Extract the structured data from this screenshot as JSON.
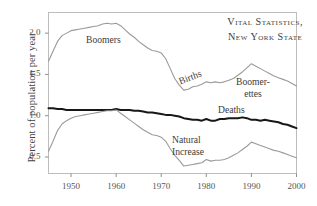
{
  "chart_data": {
    "type": "line",
    "title": "Vital Statistics, New York State",
    "title_line1": "Vital Statistics,",
    "title_line2": "New York State",
    "xlabel": "",
    "ylabel": "Percent of population per year",
    "xlim": [
      1945,
      2000
    ],
    "ylim": [
      0.3,
      2.25
    ],
    "grid": false,
    "legend": "inline-annotations",
    "xticks": [
      "1950",
      "1960",
      "1970",
      "1980",
      "1990",
      "2000"
    ],
    "xtick_values": [
      1950,
      1960,
      1970,
      1980,
      1990,
      2000
    ],
    "yticks": [
      "0.5",
      "1.0",
      "1.5",
      "2.0"
    ],
    "ytick_values": [
      0.5,
      1.0,
      1.5,
      2.0
    ],
    "annotations": [
      {
        "text": "Boomers",
        "series": "Births",
        "x": 1955,
        "y": 1.93
      },
      {
        "text": "Births",
        "series": "Births",
        "x": 1976,
        "y": 1.42
      },
      {
        "text": "Boomer-ettes",
        "line1": "Boomer-",
        "line2": "ettes",
        "series": "Births",
        "x": 1988,
        "y": 1.42
      },
      {
        "text": "Deaths",
        "series": "Deaths",
        "x": 1986,
        "y": 1.06
      },
      {
        "text": "Natural Increase",
        "line1": "Natural",
        "line2": "Increase",
        "series": "Natural Increase",
        "x": 1979,
        "y": 0.73
      }
    ],
    "x": [
      1945,
      1946,
      1947,
      1948,
      1949,
      1950,
      1951,
      1952,
      1953,
      1954,
      1955,
      1956,
      1957,
      1958,
      1959,
      1960,
      1961,
      1962,
      1963,
      1964,
      1965,
      1966,
      1967,
      1968,
      1969,
      1970,
      1971,
      1972,
      1973,
      1974,
      1975,
      1976,
      1977,
      1978,
      1979,
      1980,
      1981,
      1982,
      1983,
      1984,
      1985,
      1986,
      1987,
      1988,
      1989,
      1990,
      1991,
      1992,
      1993,
      1994,
      1995,
      1996,
      1997,
      1998,
      1999,
      2000
    ],
    "series": [
      {
        "name": "Births",
        "color": "#9a9a9a",
        "width": 1.1,
        "values": [
          1.66,
          1.78,
          1.9,
          1.97,
          2.0,
          2.03,
          2.04,
          2.05,
          2.06,
          2.07,
          2.08,
          2.09,
          2.11,
          2.12,
          2.11,
          2.12,
          2.09,
          2.04,
          1.99,
          1.95,
          1.9,
          1.86,
          1.82,
          1.79,
          1.78,
          1.76,
          1.69,
          1.57,
          1.45,
          1.37,
          1.31,
          1.32,
          1.35,
          1.36,
          1.38,
          1.41,
          1.4,
          1.41,
          1.4,
          1.41,
          1.43,
          1.45,
          1.49,
          1.53,
          1.58,
          1.63,
          1.6,
          1.57,
          1.54,
          1.51,
          1.48,
          1.46,
          1.44,
          1.42,
          1.39,
          1.36
        ]
      },
      {
        "name": "Deaths",
        "color": "#171717",
        "width": 2.0,
        "values": [
          1.09,
          1.09,
          1.08,
          1.08,
          1.07,
          1.07,
          1.07,
          1.07,
          1.07,
          1.07,
          1.07,
          1.07,
          1.07,
          1.07,
          1.07,
          1.08,
          1.07,
          1.07,
          1.07,
          1.06,
          1.06,
          1.05,
          1.04,
          1.04,
          1.03,
          1.02,
          1.01,
          1.01,
          1.0,
          0.99,
          0.97,
          0.96,
          0.95,
          0.95,
          0.94,
          0.96,
          0.94,
          0.94,
          0.96,
          0.96,
          0.97,
          0.97,
          0.97,
          0.98,
          0.97,
          0.95,
          0.95,
          0.94,
          0.95,
          0.94,
          0.93,
          0.92,
          0.9,
          0.89,
          0.87,
          0.85
        ]
      },
      {
        "name": "Natural Increase",
        "color": "#9a9a9a",
        "width": 1.1,
        "values": [
          0.57,
          0.69,
          0.82,
          0.9,
          0.94,
          0.97,
          0.99,
          1.0,
          1.01,
          1.02,
          1.03,
          1.04,
          1.05,
          1.06,
          1.06,
          1.07,
          1.03,
          0.99,
          0.95,
          0.91,
          0.87,
          0.83,
          0.8,
          0.77,
          0.76,
          0.74,
          0.69,
          0.6,
          0.52,
          0.46,
          0.39,
          0.4,
          0.41,
          0.42,
          0.43,
          0.47,
          0.45,
          0.46,
          0.46,
          0.47,
          0.49,
          0.52,
          0.55,
          0.59,
          0.63,
          0.68,
          0.66,
          0.64,
          0.62,
          0.6,
          0.58,
          0.57,
          0.55,
          0.53,
          0.51,
          0.49
        ]
      }
    ]
  },
  "axes": {
    "y_title": "Percent of population per year"
  }
}
